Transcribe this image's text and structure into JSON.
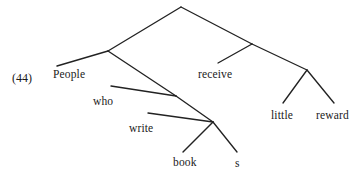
{
  "figure": {
    "example_number": "(44)",
    "background_color": "#ffffff",
    "line_color": "#222222",
    "text_color": "#1a1a1a",
    "width": 358,
    "height": 180
  },
  "tree": {
    "type": "syntax-tree",
    "sentence": "People who write books receive little reward",
    "leaves": [
      {
        "id": "people",
        "text": "People",
        "x": 53,
        "y": 68
      },
      {
        "id": "who",
        "text": "who",
        "x": 93,
        "y": 95
      },
      {
        "id": "write",
        "text": "write",
        "x": 129,
        "y": 122
      },
      {
        "id": "book",
        "text": "book",
        "x": 173,
        "y": 156
      },
      {
        "id": "s",
        "text": "s",
        "x": 235,
        "y": 157
      },
      {
        "id": "receive",
        "text": "receive",
        "x": 198,
        "y": 68
      },
      {
        "id": "little",
        "text": "little",
        "x": 271,
        "y": 109
      },
      {
        "id": "reward",
        "text": "reward",
        "x": 316,
        "y": 109
      }
    ],
    "internal_nodes": [
      {
        "id": "root",
        "x": 181,
        "y": 7
      },
      {
        "id": "subject",
        "x": 108,
        "y": 51
      },
      {
        "id": "rel-cl",
        "x": 176,
        "y": 96
      },
      {
        "id": "object",
        "x": 213,
        "y": 122
      },
      {
        "id": "predicate",
        "x": 252,
        "y": 44
      },
      {
        "id": "obj-np",
        "x": 307,
        "y": 70
      }
    ],
    "edges": [
      {
        "from": "root",
        "to": "subject",
        "x1": 181,
        "y1": 7,
        "x2": 108,
        "y2": 51
      },
      {
        "from": "root",
        "to": "predicate",
        "x1": 181,
        "y1": 7,
        "x2": 252,
        "y2": 44
      },
      {
        "from": "subject",
        "to": "people",
        "x1": 108,
        "y1": 51,
        "x2": 57,
        "y2": 66
      },
      {
        "from": "subject",
        "to": "rel-cl",
        "x1": 108,
        "y1": 51,
        "x2": 176,
        "y2": 96
      },
      {
        "from": "rel-cl",
        "to": "who",
        "x1": 176,
        "y1": 96,
        "x2": 111,
        "y2": 86
      },
      {
        "from": "rel-cl",
        "to": "object",
        "x1": 176,
        "y1": 96,
        "x2": 213,
        "y2": 122
      },
      {
        "from": "object",
        "to": "write",
        "x1": 213,
        "y1": 122,
        "x2": 148,
        "y2": 113
      },
      {
        "from": "object",
        "to": "book",
        "x1": 213,
        "y1": 122,
        "x2": 183,
        "y2": 152
      },
      {
        "from": "object",
        "to": "s",
        "x1": 213,
        "y1": 122,
        "x2": 237,
        "y2": 152
      },
      {
        "from": "predicate",
        "to": "receive",
        "x1": 252,
        "y1": 44,
        "x2": 218,
        "y2": 63
      },
      {
        "from": "predicate",
        "to": "obj-np",
        "x1": 252,
        "y1": 44,
        "x2": 307,
        "y2": 70
      },
      {
        "from": "obj-np",
        "to": "little",
        "x1": 307,
        "y1": 70,
        "x2": 283,
        "y2": 103
      },
      {
        "from": "obj-np",
        "to": "reward",
        "x1": 307,
        "y1": 70,
        "x2": 334,
        "y2": 103
      }
    ]
  }
}
